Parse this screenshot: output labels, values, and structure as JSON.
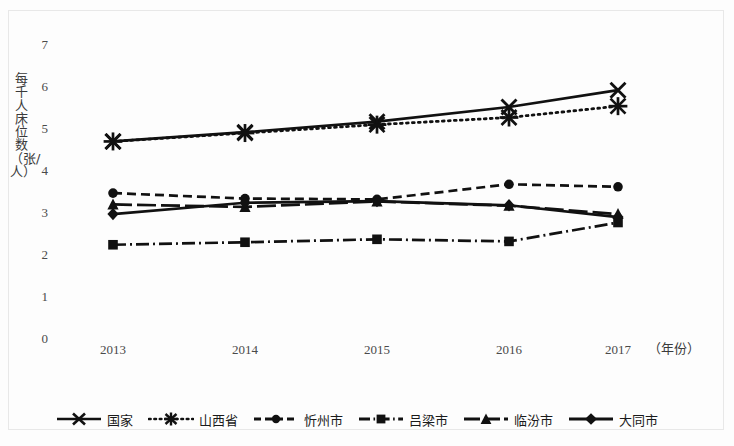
{
  "chart_data": {
    "type": "line",
    "title": "",
    "xlabel": "（年份）",
    "ylabel": "每千人床位数（张/人）",
    "categories": [
      "2013",
      "2014",
      "2015",
      "2016",
      "2017"
    ],
    "ylim": [
      0,
      7
    ],
    "yticks": [
      "0",
      "1",
      "2",
      "3",
      "4",
      "5",
      "6",
      "7"
    ],
    "grid": false,
    "legend_position": "bottom",
    "series": [
      {
        "name": "国家",
        "marker": "cross",
        "linestyle": "solid",
        "values": [
          4.68,
          4.9,
          5.15,
          5.5,
          5.9
        ]
      },
      {
        "name": "山西省",
        "marker": "asterisk",
        "linestyle": "dotted",
        "values": [
          4.68,
          4.88,
          5.08,
          5.25,
          5.52
        ]
      },
      {
        "name": "忻州市",
        "marker": "circle",
        "linestyle": "dashed",
        "values": [
          3.45,
          3.32,
          3.3,
          3.66,
          3.6
        ]
      },
      {
        "name": "吕梁市",
        "marker": "square",
        "linestyle": "dashdot",
        "values": [
          2.22,
          2.28,
          2.35,
          2.3,
          2.75
        ]
      },
      {
        "name": "临汾市",
        "marker": "triangle",
        "linestyle": "longdash",
        "values": [
          3.18,
          3.12,
          3.25,
          3.15,
          2.95
        ]
      },
      {
        "name": "大同市",
        "marker": "diamond",
        "linestyle": "solid",
        "values": [
          2.95,
          3.22,
          3.26,
          3.16,
          2.88
        ]
      }
    ]
  },
  "axis": {
    "y_ticks": [
      "7",
      "6",
      "5",
      "4",
      "3",
      "2",
      "1",
      "0"
    ],
    "x_ticks": [
      "2013",
      "2014",
      "2015",
      "2016",
      "2017"
    ],
    "y_axis_title": "每千人床位数（张/人）",
    "x_axis_title": "（年份）"
  },
  "legend": {
    "items": [
      {
        "label": "国家",
        "marker": "cross-marker"
      },
      {
        "label": "山西省",
        "marker": "asterisk-marker"
      },
      {
        "label": "忻州市",
        "marker": "circle-marker"
      },
      {
        "label": "吕梁市",
        "marker": "square-marker"
      },
      {
        "label": "临汾市",
        "marker": "triangle-marker"
      },
      {
        "label": "大同市",
        "marker": "diamond-marker"
      }
    ]
  },
  "colors": {
    "line": "#111111",
    "text": "#3a3a3a",
    "background": "#fdfdfd",
    "frame": "#e8e8e8"
  }
}
